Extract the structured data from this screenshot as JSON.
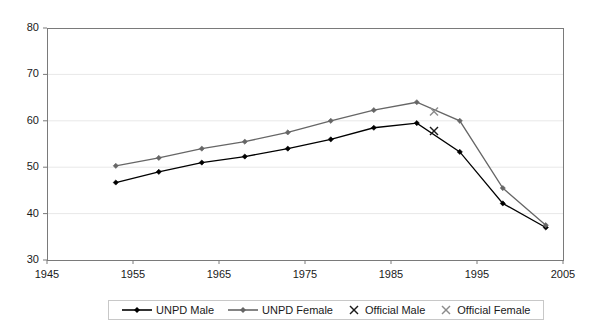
{
  "chart_data": {
    "type": "line",
    "title": "",
    "subtitle": "",
    "xlabel": "",
    "ylabel": "",
    "xlim": [
      1945,
      2005
    ],
    "ylim": [
      30,
      80
    ],
    "xticks": [
      1945,
      1955,
      1965,
      1975,
      1985,
      1995,
      2005
    ],
    "yticks": [
      30,
      40,
      50,
      60,
      70,
      80
    ],
    "grid": true,
    "grid_axis": "y",
    "legend_position": "bottom",
    "x": [
      1953,
      1958,
      1963,
      1968,
      1973,
      1978,
      1983,
      1988,
      1993,
      1998,
      2003
    ],
    "series": [
      {
        "name": "UNPD Male",
        "type": "line",
        "color": "#000000",
        "marker": "diamond",
        "values": [
          46.7,
          49.0,
          51.0,
          52.3,
          54.0,
          56.0,
          58.5,
          59.5,
          53.3,
          42.2,
          37.0
        ]
      },
      {
        "name": "UNPD Female",
        "type": "line",
        "color": "#666666",
        "marker": "diamond",
        "values": [
          50.3,
          52.0,
          54.0,
          55.5,
          57.5,
          60.0,
          62.3,
          64.0,
          60.0,
          45.5,
          37.5
        ]
      },
      {
        "name": "Official Male",
        "type": "scatter",
        "color": "#1a1a1a",
        "marker": "x",
        "x": [
          1990
        ],
        "values": [
          57.8
        ]
      },
      {
        "name": "Official Female",
        "type": "scatter",
        "color": "#8c8c8c",
        "marker": "x",
        "x": [
          1990
        ],
        "values": [
          62.0
        ]
      }
    ]
  },
  "axes": {
    "y_tick_labels": [
      "80",
      "70",
      "60",
      "50",
      "40",
      "30"
    ],
    "x_tick_labels": [
      "1945",
      "1955",
      "1965",
      "1975",
      "1985",
      "1995",
      "2005"
    ]
  },
  "legend": {
    "entries": [
      {
        "label": "UNPD Male"
      },
      {
        "label": "UNPD Female"
      },
      {
        "label": "Official Male"
      },
      {
        "label": "Official Female"
      }
    ]
  },
  "colors": {
    "male_line": "#000000",
    "female_line": "#666666",
    "official_male": "#1a1a1a",
    "official_female": "#8c8c8c",
    "plot_border": "#7a7a7a",
    "gridline": "#e8e8e8",
    "background": "#ffffff"
  }
}
